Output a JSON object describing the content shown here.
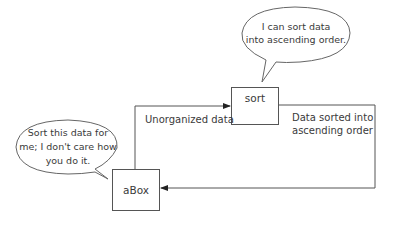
{
  "diagram": {
    "boxes": {
      "sort": {
        "label": "sort"
      },
      "abox": {
        "label": "aBox"
      }
    },
    "bubbles": {
      "sort_bubble": {
        "line1": "I can sort data",
        "line2": "into ascending order."
      },
      "abox_bubble": {
        "line1": "Sort this data for",
        "line2": "me; I don't care how",
        "line3": "you do it."
      }
    },
    "edges": {
      "to_sort": {
        "label": "Unorganized data"
      },
      "to_abox": {
        "line1": "Data sorted into",
        "line2": "ascending order"
      }
    },
    "colors": {
      "line": "#555555",
      "text": "#3a3a3a",
      "background": "#ffffff"
    }
  }
}
